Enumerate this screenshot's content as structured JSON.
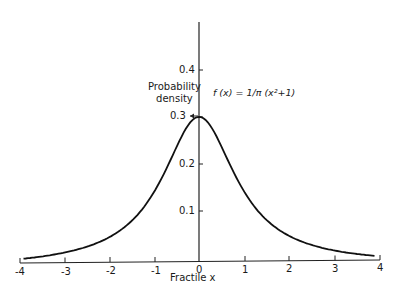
{
  "chart_data": {
    "type": "line",
    "title": "",
    "xlabel": "Fractile x",
    "ylabel": "Probability density",
    "annotation": "f (x) = 1/π (x²+1)",
    "xlim": [
      -4,
      4
    ],
    "ylim": [
      0,
      0.5
    ],
    "grid": false,
    "x_ticks": [
      "-4",
      "-3",
      "-2",
      "-1",
      "0",
      "1",
      "2",
      "3",
      "4"
    ],
    "y_ticks": [
      "0.1",
      "0.2",
      "0.3",
      "0.4"
    ],
    "series": [
      {
        "name": "Cauchy density f(x) = 1/(π(x²+1))",
        "x": [
          -4,
          -3,
          -2,
          -1.5,
          -1,
          -0.5,
          0,
          0.5,
          1,
          1.5,
          2,
          3,
          4
        ],
        "values": [
          0.0187,
          0.0318,
          0.0637,
          0.0979,
          0.1592,
          0.2546,
          0.3183,
          0.2546,
          0.1592,
          0.0979,
          0.0637,
          0.0318,
          0.0187
        ]
      }
    ]
  },
  "labels": {
    "ylabel_line1": "Probability",
    "ylabel_line2": "density",
    "xlabel": "Fractile x",
    "formula": "f (x) = 1/π (x²+1)"
  },
  "ticks": {
    "x": [
      "-4",
      "-3",
      "-2",
      "-1",
      "0",
      "1",
      "2",
      "3",
      "4"
    ],
    "y": [
      "0.1",
      "0.2",
      "0.3",
      "0.4"
    ]
  }
}
